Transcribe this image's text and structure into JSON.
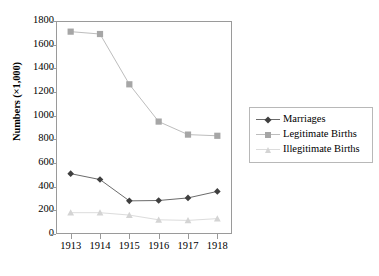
{
  "chart_data": {
    "type": "line",
    "title": "",
    "xlabel": "",
    "ylabel": "Numbers (×1,000)",
    "categories": [
      "1913",
      "1914",
      "1915",
      "1916",
      "1917",
      "1918"
    ],
    "x": [
      1913,
      1914,
      1915,
      1916,
      1917,
      1918
    ],
    "ylim": [
      0,
      1800
    ],
    "xlim": [
      "1913",
      "1918"
    ],
    "y_ticks": [
      0,
      200,
      400,
      600,
      800,
      1000,
      1200,
      1400,
      1600,
      1800
    ],
    "y_tick_labels": [
      "0",
      "200",
      "400",
      "600",
      "800",
      "1000",
      "1200",
      "1400",
      "1600",
      "1800"
    ],
    "x_tick_labels": [
      "1913",
      "1914",
      "1915",
      "1916",
      "1917",
      "1918"
    ],
    "grid": false,
    "legend_position": "right",
    "series": [
      {
        "name": "Marriages",
        "marker": "diamond",
        "color": "#3f3f3f",
        "line_color": "#6b6b6b",
        "values": [
          510,
          460,
          280,
          283,
          305,
          360
        ]
      },
      {
        "name": "Legitimate Births",
        "marker": "square",
        "color": "#a6a6a6",
        "line_color": "#bdbdbd",
        "values": [
          1710,
          1690,
          1265,
          950,
          840,
          830
        ]
      },
      {
        "name": "Illegitimate Births",
        "marker": "triangle",
        "color": "#d4d4d4",
        "line_color": "#dcdcdc",
        "values": [
          180,
          180,
          160,
          120,
          115,
          130
        ]
      }
    ]
  },
  "axis": {
    "y_title": "Numbers (×1,000)"
  },
  "legend": {
    "items": [
      {
        "label": "Marriages"
      },
      {
        "label": "Legitimate Births"
      },
      {
        "label": "Illegitimate Births"
      }
    ]
  },
  "colors": {
    "frame": "#9a9a9a",
    "background": "#ffffff",
    "marriages": "#3f3f3f",
    "legitimate_births": "#a6a6a6",
    "illegitimate_births": "#d4d4d4"
  }
}
